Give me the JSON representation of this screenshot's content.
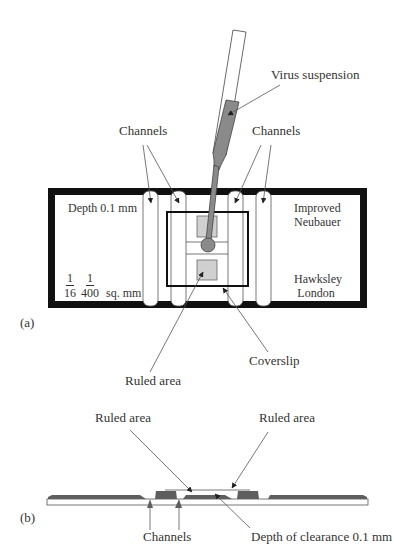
{
  "figure": {
    "panel_a": {
      "label": "(a)",
      "labels": {
        "virus_suspension": "Virus suspension",
        "channels_left": "Channels",
        "channels_right": "Channels",
        "depth": "Depth 0.1 mm",
        "brand_line1": "Improved",
        "brand_line2": "Neubauer",
        "maker_line1": "Hawksley",
        "maker_line2": "London",
        "fraction1_num": "1",
        "fraction1_den": "16",
        "fraction2_num": "1",
        "fraction2_den": "400",
        "unit": "sq. mm",
        "ruled_area": "Ruled area",
        "coverslip": "Coverslip"
      }
    },
    "panel_b": {
      "label": "(b)",
      "labels": {
        "ruled_area_left": "Ruled area",
        "ruled_area_right": "Ruled area",
        "channels": "Channels",
        "depth_of_clearance": "Depth of clearance 0.1 mm"
      }
    },
    "colors": {
      "frame": "#111111",
      "fill_grey": "#8a8a8a",
      "light_grey": "#d4d4d4",
      "dark_grey": "#5e5e5e",
      "line": "#444444"
    }
  }
}
